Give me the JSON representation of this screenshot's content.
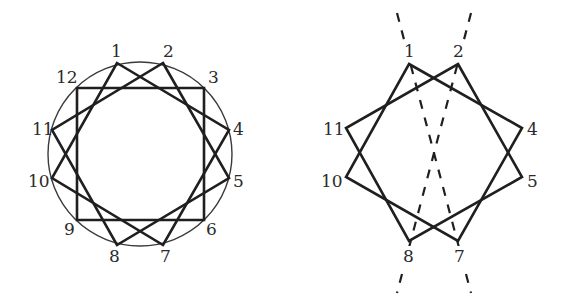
{
  "left_figure": {
    "title": "dodecagon star",
    "circle": {
      "cx": 140,
      "cy": 154,
      "r": 92
    },
    "labels": [
      {
        "text": "1",
        "x": 111,
        "y": 57
      },
      {
        "text": "2",
        "x": 163,
        "y": 57
      },
      {
        "text": "3",
        "x": 208,
        "y": 83
      },
      {
        "text": "4",
        "x": 233,
        "y": 135
      },
      {
        "text": "5",
        "x": 233,
        "y": 187
      },
      {
        "text": "6",
        "x": 206,
        "y": 235
      },
      {
        "text": "7",
        "x": 160,
        "y": 262
      },
      {
        "text": "8",
        "x": 109,
        "y": 262
      },
      {
        "text": "9",
        "x": 64,
        "y": 235
      },
      {
        "text": "10",
        "x": 28,
        "y": 187
      },
      {
        "text": "11",
        "x": 32,
        "y": 135
      },
      {
        "text": "12",
        "x": 56,
        "y": 83
      }
    ]
  },
  "right_figure": {
    "title": "octagram with dashed diagonals",
    "labels": [
      {
        "text": "1",
        "x": 404,
        "y": 57
      },
      {
        "text": "2",
        "x": 453,
        "y": 57
      },
      {
        "text": "4",
        "x": 527,
        "y": 135
      },
      {
        "text": "5",
        "x": 527,
        "y": 187
      },
      {
        "text": "7",
        "x": 454,
        "y": 262
      },
      {
        "text": "8",
        "x": 403,
        "y": 262
      },
      {
        "text": "11",
        "x": 323,
        "y": 135
      },
      {
        "text": "10",
        "x": 321,
        "y": 187
      }
    ]
  },
  "colors": {
    "stroke": "#1f1f1f",
    "thin": "#3a3a3a",
    "text": "#2a2a2a"
  }
}
